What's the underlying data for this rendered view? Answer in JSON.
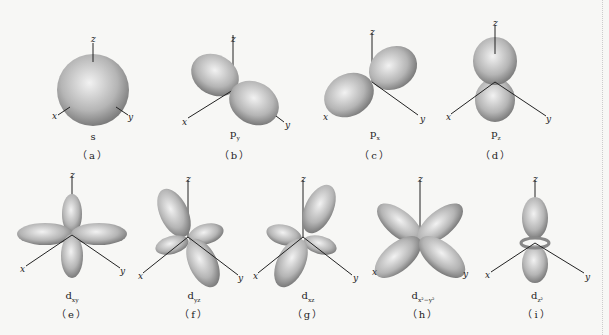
{
  "axis_labels": {
    "x": "x",
    "y": "y",
    "z": "z"
  },
  "orbitals": [
    {
      "id": "a",
      "name": "s",
      "sub": "",
      "caption": "（a）"
    },
    {
      "id": "b",
      "name": "p",
      "sub": "y",
      "caption": "（b）"
    },
    {
      "id": "c",
      "name": "p",
      "sub": "x",
      "caption": "（c）"
    },
    {
      "id": "d",
      "name": "p",
      "sub": "z",
      "caption": "（d）"
    },
    {
      "id": "e",
      "name": "d",
      "sub": "xy",
      "caption": "（e）"
    },
    {
      "id": "f",
      "name": "d",
      "sub": "yz",
      "caption": "（f）"
    },
    {
      "id": "g",
      "name": "d",
      "sub": "xz",
      "caption": "（g）"
    },
    {
      "id": "h",
      "name": "d",
      "sub": "x²−y²",
      "caption": "（h）"
    },
    {
      "id": "i",
      "name": "d",
      "sub": "z²",
      "caption": "（i）"
    }
  ],
  "colors": {
    "lobe_light": "#eeeeee",
    "lobe_dark": "#7a7a7a",
    "axis": "#222222",
    "background": "#f7f7f5"
  }
}
